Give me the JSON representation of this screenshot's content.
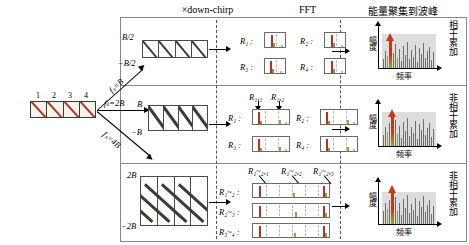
{
  "figure": {
    "columns": {
      "down_chirp": "×down-chirp",
      "fft": "FFT",
      "energy": "能量聚集到波峰"
    },
    "input_pulse_train": {
      "cell_numbers": [
        "1",
        "2",
        "3",
        "4"
      ]
    },
    "branches": [
      {
        "rate_label": "f_s=B",
        "rate_html": "fₛ=B",
        "chirp_top": "B/2",
        "chirp_bottom": "−B/2",
        "fft_labels": [
          "R₁ :",
          "R₂ :",
          "R₃ :",
          "R₄ :"
        ],
        "peak_callouts": [],
        "row_tag": "相干累加"
      },
      {
        "rate_label": "f_s=2B",
        "rate_html": "fₛ=2B",
        "chirp_top": "B",
        "chirp_bottom": "−B",
        "fft_labels": [
          "R₁ :",
          "R₂ :",
          "R₃ :",
          "R₄ :"
        ],
        "peak_callouts": [
          "R₁,₁",
          "R₁,₂"
        ],
        "row_tag": "非相干累加"
      },
      {
        "rate_label": "f_s=4B",
        "rate_html": "fₛ=4B",
        "chirp_top": "2B",
        "chirp_bottom": "−2B",
        "fft_labels": [
          "R₁~₂ :",
          "R₂~₃ :",
          "R₃~₄ :"
        ],
        "peak_callouts": [
          "R₁~₂,₁",
          "R₁~₂,₂",
          "R₁~₂,₃"
        ],
        "row_tag": "非相干累加"
      }
    ],
    "plot_axes": {
      "y": "幅度",
      "x": "频率"
    },
    "colors": {
      "peak": "#c43a18",
      "secondary_peak": "#8aa83c",
      "noise": "#6e6e6e",
      "pulse_slash": "#b23b1e",
      "chirp": "#3c3c34"
    }
  }
}
